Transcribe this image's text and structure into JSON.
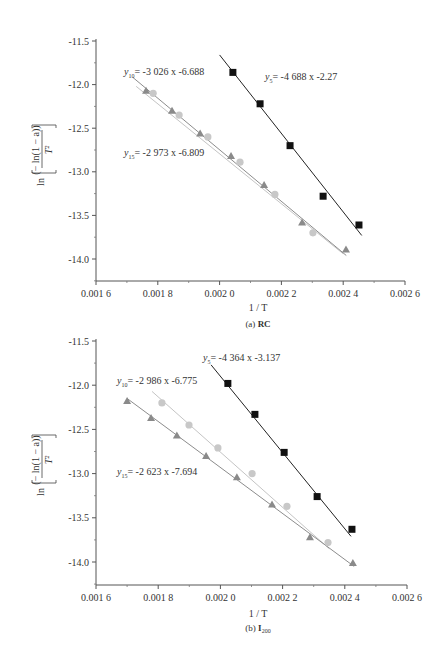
{
  "chart_data": [
    {
      "id": "a",
      "type": "scatter",
      "caption": "(a) RC",
      "caption_prefix": "(a)",
      "caption_main": "RC",
      "caption_sub": "",
      "xlabel": "1 / T",
      "ylabel": "ln[(−ln(1−a))/T²]",
      "xlim": [
        0.0016,
        0.0026
      ],
      "ylim": [
        -14.25,
        -11.5
      ],
      "xticks": [
        0.0016,
        0.0018,
        0.002,
        0.0022,
        0.0024,
        0.0026
      ],
      "xtick_labels": [
        "0.001 6",
        "0.001 8",
        "0.002 0",
        "0.002 2",
        "0.002 4",
        "0.002 6"
      ],
      "yticks": [
        -11.5,
        -12.0,
        -12.5,
        -13.0,
        -13.5,
        -14.0
      ],
      "ytick_labels": [
        "-11.5",
        "-12.0",
        "-12.5",
        "-13.0",
        "-13.5",
        "-14.0"
      ],
      "grid": false,
      "series": [
        {
          "name": "y5",
          "marker": "square",
          "color": "#111111",
          "equation": "y5 = -4 688 x -2.27",
          "eq_sub": "5",
          "eq_text": "= -4 688 x -2.27",
          "fit_line": [
            [
              0.002,
              -11.66
            ],
            [
              0.00246,
              -13.73
            ]
          ],
          "x": [
            0.002043,
            0.002131,
            0.002228,
            0.002335,
            0.002451
          ],
          "y": [
            -11.86,
            -12.22,
            -12.7,
            -13.28,
            -13.61
          ]
        },
        {
          "name": "y10",
          "marker": "circle",
          "color": "#c8c8c8",
          "equation": "y10 = -3 026 x -6.688",
          "eq_sub": "10",
          "eq_text": "= -3 026 x -6.688",
          "fit_line": [
            [
              0.00173,
              -12.02
            ],
            [
              0.0024,
              -13.94
            ]
          ],
          "x": [
            0.001785,
            0.001869,
            0.001962,
            0.002066,
            0.002179,
            0.002302
          ],
          "y": [
            -12.1,
            -12.35,
            -12.6,
            -12.89,
            -13.26,
            -13.7
          ]
        },
        {
          "name": "y15",
          "marker": "triangle",
          "color": "#8a8a8a",
          "equation": "y15 = -2 973 x -6.809",
          "eq_sub": "15",
          "eq_text": "= -2 973 x -6.809",
          "fit_line": [
            [
              0.00172,
              -11.92
            ],
            [
              0.00241,
              -13.96
            ]
          ],
          "x": [
            0.001762,
            0.001846,
            0.001937,
            0.002037,
            0.002144,
            0.002267,
            0.002409
          ],
          "y": [
            -12.07,
            -12.3,
            -12.56,
            -12.82,
            -13.15,
            -13.58,
            -13.89
          ]
        }
      ]
    },
    {
      "id": "b",
      "type": "scatter",
      "caption": "(b) I200",
      "caption_prefix": "(b)",
      "caption_main": "I",
      "caption_sub": "200",
      "xlabel": "1 / T",
      "ylabel": "ln[(−ln(1−a))/T²]",
      "xlim": [
        0.0016,
        0.0026
      ],
      "ylim": [
        -14.25,
        -11.5
      ],
      "xticks": [
        0.0016,
        0.0018,
        0.002,
        0.0022,
        0.0024,
        0.0026
      ],
      "xtick_labels": [
        "0.001 6",
        "0.001 8",
        "0.002 0",
        "0.002 2",
        "0.002 4",
        "0.002 6"
      ],
      "yticks": [
        -11.5,
        -12.0,
        -12.5,
        -13.0,
        -13.5,
        -14.0
      ],
      "ytick_labels": [
        "-11.5",
        "-12.0",
        "-12.5",
        "-13.0",
        "-13.5",
        "-14.0"
      ],
      "grid": false,
      "series": [
        {
          "name": "y5",
          "marker": "square",
          "color": "#111111",
          "equation": "y5 = -4 364 x -3.137",
          "eq_sub": "5",
          "eq_text": "= -4 364 x -3.137",
          "fit_line": [
            [
              0.00197,
              -11.77
            ],
            [
              0.00242,
              -13.71
            ]
          ],
          "x": [
            0.002024,
            0.002111,
            0.002205,
            0.002311,
            0.002423
          ],
          "y": [
            -11.98,
            -12.33,
            -12.76,
            -13.26,
            -13.63
          ]
        },
        {
          "name": "y10",
          "marker": "circle",
          "color": "#c8c8c8",
          "equation": "y10 = -2 986 x -6.775",
          "eq_sub": "10",
          "eq_text": "= -2 986 x -6.775",
          "fit_line": [
            [
              0.00178,
              -12.07
            ],
            [
              0.00235,
              -13.85
            ]
          ],
          "x": [
            0.001812,
            0.001899,
            0.001992,
            0.002102,
            0.002214,
            0.002346
          ],
          "y": [
            -12.2,
            -12.45,
            -12.71,
            -13.0,
            -13.37,
            -13.78
          ]
        },
        {
          "name": "y15",
          "marker": "triangle",
          "color": "#8a8a8a",
          "equation": "y15 = -2 623 x -7.694",
          "eq_sub": "15",
          "eq_text": "= -2 623 x -7.694",
          "fit_line": [
            [
              0.0017,
              -12.15
            ],
            [
              0.00243,
              -14.05
            ]
          ],
          "x": [
            0.0017,
            0.001777,
            0.00186,
            0.001954,
            0.002053,
            0.002166,
            0.002288,
            0.002426
          ],
          "y": [
            -12.18,
            -12.37,
            -12.57,
            -12.8,
            -13.04,
            -13.35,
            -13.72,
            -14.01
          ]
        }
      ]
    }
  ]
}
